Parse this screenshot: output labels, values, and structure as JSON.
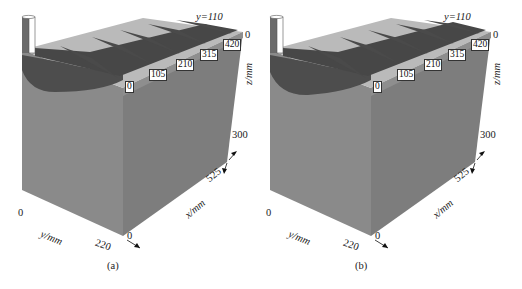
{
  "figure": {
    "panels": [
      {
        "id": "a",
        "caption": "(a)",
        "y_plane_label": "y=110",
        "x_section_labels": [
          "0",
          "105",
          "210",
          "315",
          "420"
        ],
        "axes": {
          "z_label": "z/mm",
          "z_min": "0",
          "z_max": "300",
          "x_label": "x/mm",
          "x_min": "0",
          "x_max": "525",
          "y_label": "y/mm",
          "y_min": "0",
          "y_max": "220"
        }
      },
      {
        "id": "b",
        "caption": "(b)",
        "y_plane_label": "y=110",
        "x_section_labels": [
          "0",
          "105",
          "210",
          "315",
          "420"
        ],
        "axes": {
          "z_label": "z/mm",
          "z_min": "0",
          "z_max": "300",
          "x_label": "x/mm",
          "x_min": "0",
          "x_max": "525",
          "y_label": "y/mm",
          "y_min": "0",
          "y_max": "220"
        }
      }
    ],
    "colors": {
      "box_left_face": "#8a8a8a",
      "box_right_face": "#7c7c7c",
      "top_face": "#b9b9b9",
      "fin_dark": "#4a4a4a",
      "outline": "#3a3a3a"
    }
  }
}
